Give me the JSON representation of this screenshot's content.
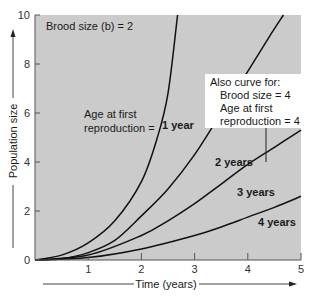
{
  "chart_data": {
    "type": "line",
    "title": "",
    "xlabel": "Time (years)",
    "ylabel": "Population size",
    "xlim": [
      0,
      5
    ],
    "ylim": [
      0,
      10
    ],
    "xticks": [
      "1",
      "2",
      "3",
      "4",
      "5"
    ],
    "yticks": [
      "0",
      "2",
      "4",
      "6",
      "8",
      "10"
    ],
    "grid": false,
    "annotations": {
      "brood": "Brood size (b) = 2",
      "age_line1": "Age at first",
      "age_line2": "reproduction =",
      "box_line1": "Also curve for:",
      "box_line2": "Brood size = 4",
      "box_line3": "Age at first",
      "box_line4": "reproduction = 4"
    },
    "series": [
      {
        "name": "1 year",
        "points": [
          [
            0,
            0
          ],
          [
            0.5,
            0.2
          ],
          [
            1,
            0.7
          ],
          [
            1.5,
            1.6
          ],
          [
            2,
            3.2
          ],
          [
            2.3,
            5.0
          ],
          [
            2.5,
            6.8
          ],
          [
            2.68,
            10
          ]
        ]
      },
      {
        "name": "2 years",
        "points": [
          [
            0,
            0
          ],
          [
            0.5,
            0.05
          ],
          [
            1,
            0.3
          ],
          [
            1.5,
            0.8
          ],
          [
            2,
            1.8
          ],
          [
            2.5,
            2.9
          ],
          [
            3,
            4.3
          ],
          [
            3.5,
            6.0
          ],
          [
            4,
            7.7
          ],
          [
            4.4,
            9.1
          ],
          [
            4.67,
            10
          ]
        ]
      },
      {
        "name": "3 years",
        "points": [
          [
            0,
            0
          ],
          [
            1,
            0.2
          ],
          [
            2,
            1.0
          ],
          [
            2.5,
            1.6
          ],
          [
            3,
            2.3
          ],
          [
            3.5,
            3.1
          ],
          [
            4,
            3.9
          ],
          [
            4.5,
            4.6
          ],
          [
            5,
            5.3
          ]
        ]
      },
      {
        "name": "4 years",
        "points": [
          [
            0,
            0
          ],
          [
            1,
            0.1
          ],
          [
            2,
            0.45
          ],
          [
            3,
            1.0
          ],
          [
            3.5,
            1.35
          ],
          [
            4,
            1.75
          ],
          [
            4.5,
            2.15
          ],
          [
            5,
            2.6
          ]
        ]
      }
    ],
    "colors": {
      "plot_bg": "#cccccc",
      "curve": "#111111",
      "box_bg": "#ffffff"
    }
  }
}
